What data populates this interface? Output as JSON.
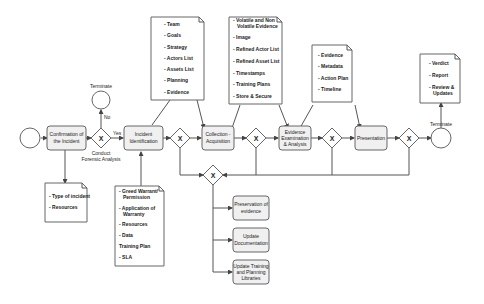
{
  "diagram": {
    "start_event": "start-circle",
    "tasks": {
      "confirmation": [
        "Confirmation of",
        "the Incident"
      ],
      "identification": [
        "Incident",
        "Identification"
      ],
      "collection": [
        "Collection -",
        "Acquisition"
      ],
      "examination": [
        "Evidence",
        "Examination",
        "& Analysis"
      ],
      "presentation": [
        "Presentation"
      ],
      "preservation": [
        "Preservation of",
        "evidence"
      ],
      "update_doc": [
        "Update",
        "Documentation"
      ],
      "update_training": [
        "Update Training",
        "and Planning",
        "Libraries"
      ]
    },
    "gateways": {
      "symbol": "X",
      "label_conduct": [
        "Conduct",
        "Forensic Analysis"
      ]
    },
    "flow_labels": {
      "yes": "Yes",
      "no": "No",
      "terminate_top": "Terminate",
      "terminate_right": "Terminate"
    },
    "documents": {
      "confirmation_doc": [
        "- Type of incident",
        "- Resources"
      ],
      "identification_in_doc": [
        "- Greed Warrant/",
        "  Permission",
        "- Application of",
        "  Warranty",
        "- Resources",
        "- Data",
        "Training Plan",
        "- SLA"
      ],
      "identification_out_doc": [
        "- Team",
        "- Goals",
        "- Strategy",
        "- Actors List",
        "- Assets List",
        "- Planning",
        "- Evidence"
      ],
      "collection_doc": [
        "- Volatile and Non",
        "  Volatile Evidence",
        "- Image",
        "- Refined Actor List",
        "- Refined Asset List",
        "- Timestamps",
        "- Training Plans",
        "- Store & Secure"
      ],
      "examination_doc": [
        "- Evidence",
        "- Metadata",
        "- Action Plan",
        "- Timeline"
      ],
      "final_doc": [
        "- Verdict",
        "- Report",
        "- Review &",
        "  Updates"
      ]
    }
  }
}
